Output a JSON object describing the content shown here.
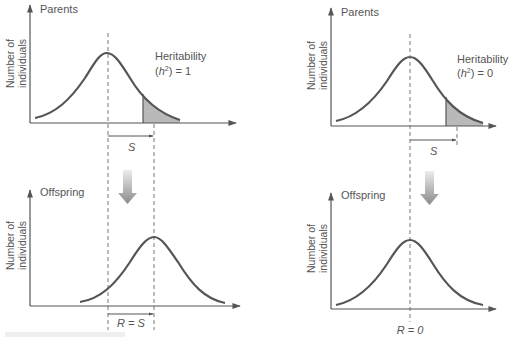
{
  "figure": {
    "colors": {
      "curve": "#555555",
      "axis": "#555555",
      "dashed": "#777777",
      "shade": "#b8b8b8",
      "arrow_top": "#e0e0e0",
      "arrow_bottom": "#8a8a8a",
      "text": "#555555"
    },
    "panels": [
      {
        "id": "high-heritability",
        "parents": {
          "title": "Parents",
          "ylabel_line1": "Number of",
          "ylabel_line2": "individuals",
          "heritability_label": "Heritability",
          "heritability_value_prefix": "(",
          "heritability_symbol": "h",
          "heritability_exp": "2",
          "heritability_value_suffix": ") = 1",
          "selection_label": "S"
        },
        "offspring": {
          "title": "Offspring",
          "ylabel_line1": "Number of",
          "ylabel_line2": "individuals",
          "response_label": "R = S"
        }
      },
      {
        "id": "zero-heritability",
        "parents": {
          "title": "Parents",
          "ylabel_line1": "Number of",
          "ylabel_line2": "individuals",
          "heritability_label": "Heritability",
          "heritability_value_prefix": "(",
          "heritability_symbol": "h",
          "heritability_exp": "2",
          "heritability_value_suffix": ") = 0",
          "selection_label": "S"
        },
        "offspring": {
          "title": "Offspring",
          "ylabel_line1": "Number of",
          "ylabel_line2": "individuals",
          "response_label": "R = 0"
        }
      }
    ]
  }
}
